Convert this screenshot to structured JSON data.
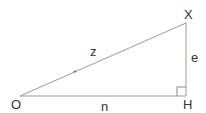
{
  "diagram": {
    "type": "right-triangle",
    "vertices": {
      "O": {
        "label": "O",
        "x": 20,
        "y": 96
      },
      "H": {
        "label": "H",
        "x": 186,
        "y": 96
      },
      "X": {
        "label": "X",
        "x": 186,
        "y": 23
      }
    },
    "sides": {
      "hypotenuse": {
        "label": "z",
        "from": "O",
        "to": "X"
      },
      "base": {
        "label": "n",
        "from": "O",
        "to": "H"
      },
      "height": {
        "label": "e",
        "from": "H",
        "to": "X"
      }
    },
    "right_angle_at": "H",
    "colors": {
      "stroke": "#888888",
      "text": "#333333"
    }
  }
}
